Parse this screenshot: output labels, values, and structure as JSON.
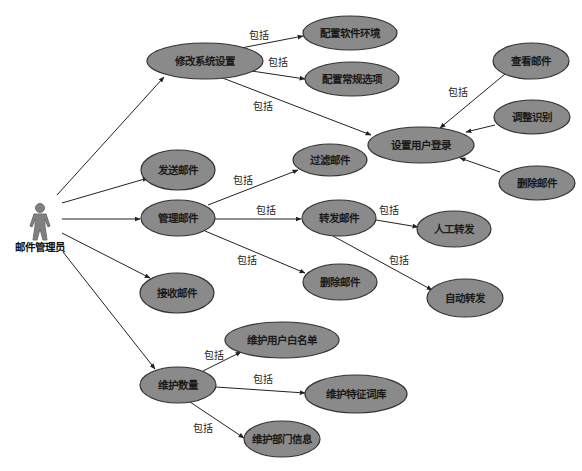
{
  "diagram": {
    "type": "use-case",
    "colors": {
      "ellipse_fill": "#8a8a8a",
      "ellipse_stroke": "#333333",
      "line": "#222222",
      "actor": "#808080"
    },
    "actor": {
      "id": "admin",
      "label": "邮件管理员",
      "x": 40,
      "y": 228
    },
    "use_cases": [
      {
        "id": "modify_settings",
        "label": "修改系统设置",
        "cx": 205,
        "cy": 61,
        "rx": 58,
        "ry": 18
      },
      {
        "id": "config_software_env",
        "label": "配置软件环境",
        "cx": 350,
        "cy": 33,
        "rx": 47,
        "ry": 17
      },
      {
        "id": "config_general_options",
        "label": "配置常规选项",
        "cx": 352,
        "cy": 79,
        "rx": 47,
        "ry": 17
      },
      {
        "id": "view_mail",
        "label": "查看邮件",
        "cx": 531,
        "cy": 61,
        "rx": 38,
        "ry": 18
      },
      {
        "id": "adjust_recognition",
        "label": "调整识别",
        "cx": 532,
        "cy": 117,
        "rx": 38,
        "ry": 17
      },
      {
        "id": "set_user_login",
        "label": "设置用户登录",
        "cx": 421,
        "cy": 145,
        "rx": 53,
        "ry": 18
      },
      {
        "id": "delete_mail_right",
        "label": "删除邮件",
        "cx": 537,
        "cy": 183,
        "rx": 38,
        "ry": 17
      },
      {
        "id": "send_mail",
        "label": "发送邮件",
        "cx": 178,
        "cy": 170,
        "rx": 37,
        "ry": 20
      },
      {
        "id": "filter_mail",
        "label": "过滤邮件",
        "cx": 330,
        "cy": 160,
        "rx": 37,
        "ry": 16
      },
      {
        "id": "manage_mail",
        "label": "管理邮件",
        "cx": 178,
        "cy": 218,
        "rx": 37,
        "ry": 18
      },
      {
        "id": "forward_mail",
        "label": "转发邮件",
        "cx": 339,
        "cy": 218,
        "rx": 37,
        "ry": 18
      },
      {
        "id": "manual_forward",
        "label": "人工转发",
        "cx": 454,
        "cy": 229,
        "rx": 37,
        "ry": 18
      },
      {
        "id": "delete_mail_mid",
        "label": "删除邮件",
        "cx": 340,
        "cy": 282,
        "rx": 37,
        "ry": 18
      },
      {
        "id": "auto_forward",
        "label": "自动转发",
        "cx": 465,
        "cy": 298,
        "rx": 38,
        "ry": 19
      },
      {
        "id": "receive_mail",
        "label": "接收邮件",
        "cx": 177,
        "cy": 293,
        "rx": 37,
        "ry": 20
      },
      {
        "id": "maintain_whitelist",
        "label": "维护用户白名单",
        "cx": 282,
        "cy": 340,
        "rx": 57,
        "ry": 18
      },
      {
        "id": "maintain_data",
        "label": "维护数量",
        "cx": 178,
        "cy": 385,
        "rx": 38,
        "ry": 18
      },
      {
        "id": "maintain_keywords",
        "label": "维护特征词库",
        "cx": 356,
        "cy": 394,
        "rx": 51,
        "ry": 19
      },
      {
        "id": "maintain_dept_info",
        "label": "维护部门信息",
        "cx": 282,
        "cy": 439,
        "rx": 38,
        "ry": 18
      }
    ],
    "edges": [
      {
        "from": [
          57,
          195
        ],
        "to": [
          164,
          77
        ],
        "label": "",
        "arrow": true
      },
      {
        "from": [
          62,
          203
        ],
        "to": [
          148,
          178
        ],
        "label": "",
        "arrow": true
      },
      {
        "from": [
          62,
          219
        ],
        "to": [
          140,
          219
        ],
        "label": "",
        "arrow": true
      },
      {
        "from": [
          62,
          233
        ],
        "to": [
          150,
          278
        ],
        "label": "",
        "arrow": true
      },
      {
        "from": [
          63,
          252
        ],
        "to": [
          155,
          369
        ],
        "label": "",
        "arrow": true
      },
      {
        "from": [
          236,
          49
        ],
        "to": [
          303,
          36
        ],
        "label": "包括",
        "lx": 249,
        "ly": 39,
        "arrow": true
      },
      {
        "from": [
          245,
          70
        ],
        "to": [
          305,
          79
        ],
        "label": "包括",
        "lx": 268,
        "ly": 66,
        "arrow": true
      },
      {
        "from": [
          220,
          77
        ],
        "to": [
          371,
          135
        ],
        "label": "包括",
        "lx": 253,
        "ly": 110,
        "arrow": true
      },
      {
        "from": [
          505,
          74
        ],
        "to": [
          440,
          128
        ],
        "label": "包括",
        "lx": 448,
        "ly": 96,
        "arrow": true
      },
      {
        "from": [
          495,
          125
        ],
        "to": [
          466,
          132
        ],
        "label": "",
        "arrow": true
      },
      {
        "from": [
          500,
          172
        ],
        "to": [
          460,
          158
        ],
        "label": "",
        "arrow": true
      },
      {
        "from": [
          208,
          205
        ],
        "to": [
          298,
          170
        ],
        "label": "包括",
        "lx": 233,
        "ly": 184,
        "arrow": true
      },
      {
        "from": [
          215,
          219
        ],
        "to": [
          301,
          219
        ],
        "label": "包括",
        "lx": 256,
        "ly": 214,
        "arrow": true
      },
      {
        "from": [
          205,
          231
        ],
        "to": [
          305,
          273
        ],
        "label": "包括",
        "lx": 237,
        "ly": 264,
        "arrow": true
      },
      {
        "from": [
          376,
          220
        ],
        "to": [
          418,
          227
        ],
        "label": "包括",
        "lx": 379,
        "ly": 214,
        "arrow": true
      },
      {
        "from": [
          333,
          236
        ],
        "to": [
          432,
          290
        ],
        "label": "包括",
        "lx": 389,
        "ly": 264,
        "arrow": true
      },
      {
        "from": [
          203,
          371
        ],
        "to": [
          241,
          352
        ],
        "label": "包括",
        "lx": 204,
        "ly": 359,
        "arrow": true
      },
      {
        "from": [
          216,
          387
        ],
        "to": [
          305,
          393
        ],
        "label": "包括",
        "lx": 253,
        "ly": 383,
        "arrow": true
      },
      {
        "from": [
          190,
          402
        ],
        "to": [
          244,
          438
        ],
        "label": "包括",
        "lx": 193,
        "ly": 432,
        "arrow": true
      }
    ]
  }
}
